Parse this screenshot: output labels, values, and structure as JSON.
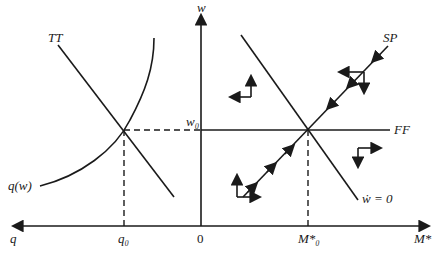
{
  "diagram": {
    "labels": {
      "w_axis": "w",
      "q_axis": "q",
      "m_axis": "M*",
      "origin": "0",
      "w0": "w₀",
      "q0": "q₀",
      "m0": "M*₀",
      "tt": "TT",
      "qw": "q(w)",
      "sp": "SP",
      "ff": "FF",
      "wdot": "ẇ = 0"
    },
    "colors": {
      "ink": "#1a1a1a",
      "background": "#ffffff"
    }
  }
}
